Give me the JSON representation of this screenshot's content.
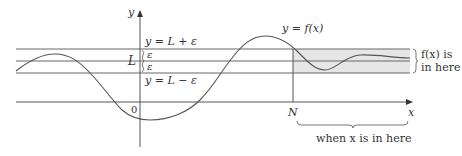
{
  "diagram": {
    "axes": {
      "x_label": "x",
      "y_label": "y",
      "origin_label": "0"
    },
    "horizontal_lines": {
      "upper_label": "y = L + ε",
      "middle_label": "L",
      "lower_label": "y = L − ε",
      "epsilon_upper": "ε",
      "epsilon_lower": "ε"
    },
    "curve": {
      "label": "y = f(x)"
    },
    "threshold": {
      "label": "N"
    },
    "annotations": {
      "band_note_line1": "f(x) is",
      "band_note_line2": "in here",
      "x_range_note": "when x is in here"
    },
    "colors": {
      "band_fill": "#e6e6e6",
      "lines": "#666666",
      "text": "#333333"
    }
  }
}
